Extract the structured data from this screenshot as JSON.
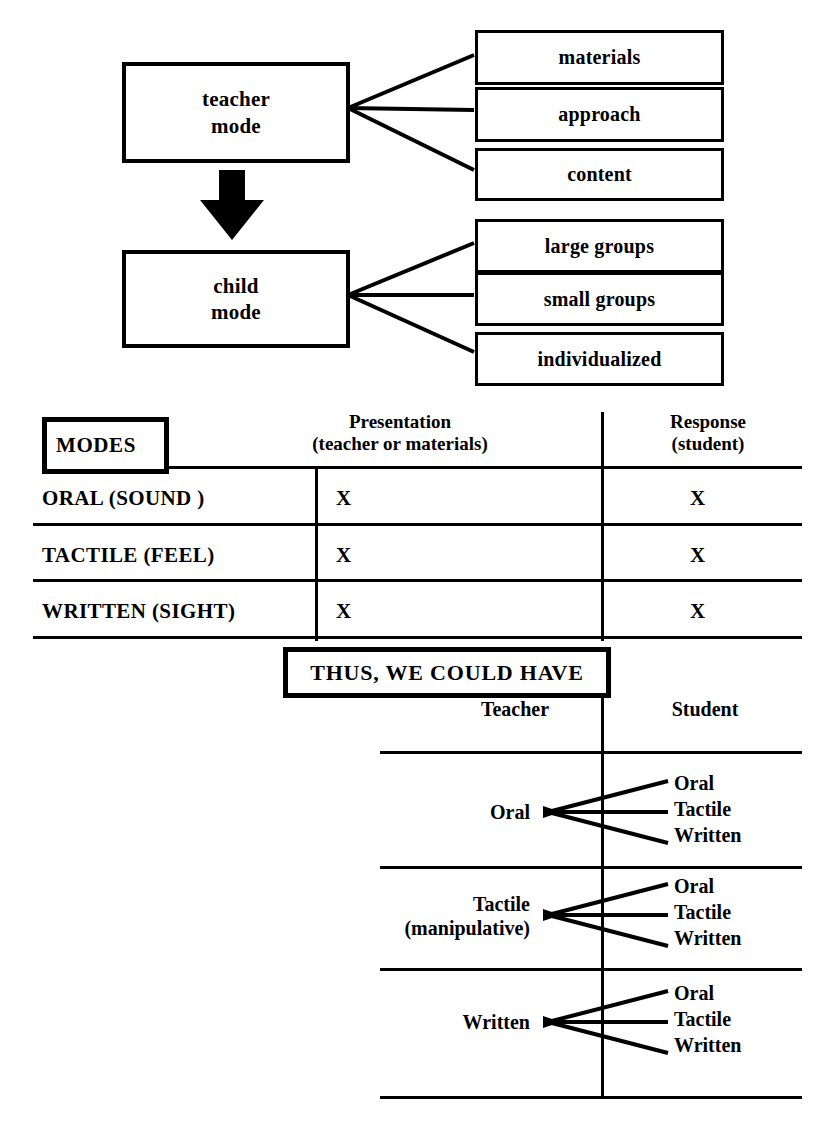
{
  "flow": {
    "teacher": {
      "line1": "teacher",
      "line2": "mode",
      "branches": [
        "materials",
        "approach",
        "content"
      ]
    },
    "arrow_icon": "down-arrow-icon",
    "child": {
      "line1": "child",
      "line2": "mode",
      "branches": [
        "large groups",
        "small groups",
        "individualized"
      ]
    }
  },
  "modes_table": {
    "badge": "MODES",
    "headers": [
      {
        "title": "Presentation",
        "sub": "(teacher or materials)"
      },
      {
        "title": "Response",
        "sub": "(student)"
      }
    ],
    "rows": [
      {
        "label": "ORAL (SOUND )",
        "presentation": "X",
        "response": "X"
      },
      {
        "label": "TACTILE  (FEEL)",
        "presentation": "X",
        "response": "X"
      },
      {
        "label": "WRITTEN (SIGHT)",
        "presentation": "X",
        "response": "X"
      }
    ]
  },
  "thus": {
    "banner": "THUS, WE COULD HAVE",
    "headers": [
      "Teacher",
      "Student"
    ],
    "rows": [
      {
        "teacher_line1": "Oral",
        "teacher_line2": "",
        "student": [
          "Oral",
          "Tactile",
          "Written"
        ]
      },
      {
        "teacher_line1": "Tactile",
        "teacher_line2": "(manipulative)",
        "student": [
          "Oral",
          "Tactile",
          "Written"
        ]
      },
      {
        "teacher_line1": "Written",
        "teacher_line2": "",
        "student": [
          "Oral",
          "Tactile",
          "Written"
        ]
      }
    ]
  },
  "colors": {
    "ink": "#000000",
    "paper": "#ffffff"
  }
}
